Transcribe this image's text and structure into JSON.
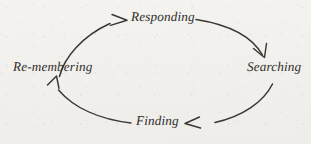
{
  "diagram": {
    "type": "cycle",
    "title": "",
    "direction": "clockwise",
    "stroke_color": "#3a3734",
    "background_color": "#f2f1ed",
    "text_color": "#2e2c2b",
    "nodes": [
      {
        "id": "responding",
        "label": "Responding",
        "position": "top"
      },
      {
        "id": "searching",
        "label": "Searching",
        "position": "right"
      },
      {
        "id": "finding",
        "label": "Finding",
        "position": "bottom"
      },
      {
        "id": "remembering",
        "label": "Re-membering",
        "position": "left"
      }
    ],
    "edges": [
      {
        "from": "remembering",
        "to": "responding",
        "arrow": "arrowhead-to-responding",
        "points": "right"
      },
      {
        "from": "responding",
        "to": "searching",
        "arrow": "arrowhead-to-searching",
        "points": "down-right"
      },
      {
        "from": "searching",
        "to": "finding",
        "arrow": "arrowhead-to-finding",
        "points": "left"
      },
      {
        "from": "finding",
        "to": "remembering",
        "arrow": "arrowhead-to-remembering",
        "points": "up-left"
      }
    ]
  }
}
